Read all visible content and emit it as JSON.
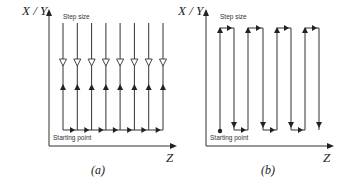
{
  "figure_a": {
    "caption": "(a)",
    "y_axis_label": "X / Y",
    "x_axis_label": "Z",
    "step_size_label": "Step size",
    "starting_point_label": "Starting point",
    "line_count": 8,
    "description": "Parallel vertical scan lines; each line has a downward open-arrow in upper half and an upward filled-arrow in lower half; bottom horizontal line with right-pointing arrows connecting lines"
  },
  "figure_b": {
    "caption": "(b)",
    "y_axis_label": "X / Y",
    "x_axis_label": "Z",
    "step_size_label": "Step size",
    "starting_point_label": "Starting point",
    "line_count": 8,
    "description": "Serpentine (raster) scan path: up, step right at top, down, step right at bottom, repeated; starts at a dot"
  },
  "colors": {
    "line": "#333333",
    "background": "#ffffff"
  }
}
